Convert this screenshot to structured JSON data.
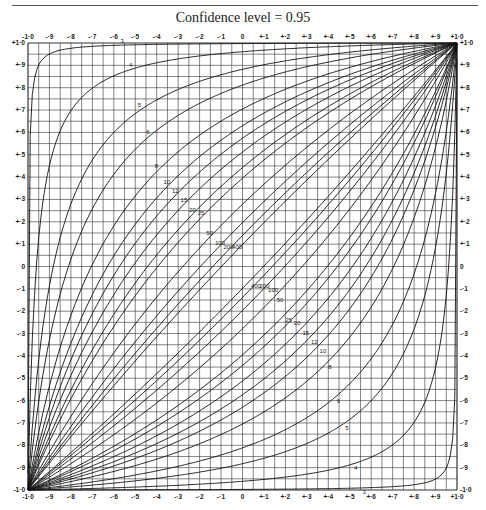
{
  "title": "Confidence level = 0.95",
  "chart_data": {
    "type": "line",
    "title": "Confidence level = 0.95",
    "xlabel": "",
    "ylabel": "",
    "xlim": [
      -1.0,
      1.0
    ],
    "ylim": [
      -1.0,
      1.0
    ],
    "grid": true,
    "grid_step": 0.05,
    "x_ticks_top": [
      "-1·0",
      "-·9",
      "-·8",
      "-·7",
      "-·6",
      "-·5",
      "-·4",
      "-·3",
      "-·2",
      "-·1",
      "0",
      "+·1",
      "+·2",
      "+·3",
      "+·4",
      "+·5",
      "+·6",
      "+·7",
      "+·8",
      "+·9",
      "+1·0"
    ],
    "x_ticks_bottom": [
      "-1·0",
      "-·9",
      "-·8",
      "-·7",
      "-·6",
      "-·5",
      "-·4",
      "-·3",
      "-·2",
      "-·1",
      "0",
      "+·1",
      "+·2",
      "+·3",
      "+·4",
      "+·5",
      "+·6",
      "+·7",
      "+·8",
      "+·9",
      "+1·0"
    ],
    "y_ticks_left": [
      "+1·0",
      "+·9",
      "+·8",
      "+·7",
      "+·6",
      "+·5",
      "+·4",
      "+·3",
      "+·2",
      "+·1",
      "0",
      "-·1",
      "-·2",
      "-·3",
      "-·4",
      "-·5",
      "-·6",
      "-·7",
      "-·8",
      "-·9",
      "-1·0"
    ],
    "y_ticks_right": [
      "+1·0",
      "+·9",
      "+·8",
      "+·7",
      "+·6",
      "+·5",
      "+·4",
      "+·3",
      "+·2",
      "+·1",
      "0",
      "-·1",
      "-·2",
      "-·3",
      "-·4",
      "-·5",
      "-·6",
      "-·7",
      "-·8",
      "-·9",
      "-1·0"
    ],
    "series_labels_upper": [
      "3",
      "4",
      "5",
      "6",
      "8",
      "10",
      "12",
      "15",
      "20",
      "25",
      "50",
      "100",
      "200",
      "400"
    ],
    "series_labels_lower": [
      "400",
      "200",
      "100",
      "50",
      "25",
      "20",
      "15",
      "12",
      "10",
      "8",
      "6",
      "5",
      "4",
      "3"
    ],
    "series": [
      {
        "name": "n=3",
        "n": 3
      },
      {
        "name": "n=4",
        "n": 4
      },
      {
        "name": "n=5",
        "n": 5
      },
      {
        "name": "n=6",
        "n": 6
      },
      {
        "name": "n=8",
        "n": 8
      },
      {
        "name": "n=10",
        "n": 10
      },
      {
        "name": "n=12",
        "n": 12
      },
      {
        "name": "n=15",
        "n": 15
      },
      {
        "name": "n=20",
        "n": 20
      },
      {
        "name": "n=25",
        "n": 25
      },
      {
        "name": "n=50",
        "n": 50
      },
      {
        "name": "n=100",
        "n": 100
      },
      {
        "name": "n=200",
        "n": 200
      },
      {
        "name": "n=400",
        "n": 400
      }
    ],
    "confidence_level": 0.95
  }
}
